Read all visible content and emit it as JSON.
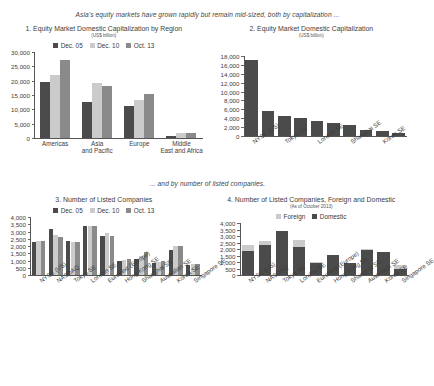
{
  "banner": {
    "top": "Asia's equity markets have grown rapidly but remain mid-sized, both by capitalization ...",
    "middle": "... and by number of listed companies."
  },
  "chart_data": [
    {
      "id": "panel1",
      "type": "bar",
      "title": "1. Equity Market Domestic Capitalization by Region",
      "subtitle": "(US$ billion)",
      "xlabel": "",
      "ylabel": "",
      "ylim": [
        0,
        30000
      ],
      "yticks": [
        0,
        5000,
        10000,
        15000,
        20000,
        25000,
        30000
      ],
      "yticklabels": [
        "0",
        "5,000",
        "10,000",
        "15,000",
        "20,000",
        "25,000",
        "30,000"
      ],
      "grid": false,
      "legend_position": "top",
      "categories": [
        "Americas",
        "Asia and Pacific",
        "Europe",
        "Middle East and Africa"
      ],
      "series": [
        {
          "name": "Dec. 05",
          "color": "#4b4b4b",
          "values": [
            19400,
            12700,
            11300,
            700
          ]
        },
        {
          "name": "Dec. 10",
          "color": "#cbcbcb",
          "values": [
            22100,
            19200,
            13300,
            1600
          ]
        },
        {
          "name": "Oct. 13",
          "color": "#8a8a8a",
          "values": [
            27200,
            18300,
            15200,
            1750
          ]
        }
      ]
    },
    {
      "id": "panel2",
      "type": "bar",
      "title": "2. Equity Market Domestic Capitalization",
      "subtitle": "(US$ billion)",
      "xlabel": "",
      "ylabel": "",
      "ylim": [
        0,
        18000
      ],
      "yticks": [
        0,
        2000,
        4000,
        6000,
        8000,
        10000,
        12000,
        14000,
        16000,
        18000
      ],
      "yticklabels": [
        "0",
        "2,000",
        "4,000",
        "6,000",
        "8,000",
        "10,000",
        "12,000",
        "14,000",
        "16,000",
        "18,000"
      ],
      "grid": false,
      "legend_position": "none",
      "categories": [
        "NYSE (US)",
        "NASDAQ",
        "Tokyo SE",
        "Euronext (Europe)",
        "London SE",
        "Hong Kong SE",
        "Shanghai SE",
        "Australian SE",
        "Korea SE",
        "Singapore SE"
      ],
      "xticklabels_shown": [
        "NYSE (US)",
        "",
        "Tokyo SE",
        "",
        "London SE",
        "",
        "Shanghai SE",
        "",
        "Korea SE",
        ""
      ],
      "series": [
        {
          "name": "Capitalization",
          "color": "#4b4b4b",
          "values": [
            17100,
            5700,
            4400,
            4150,
            3400,
            3000,
            2400,
            1400,
            1200,
            750
          ]
        }
      ]
    },
    {
      "id": "panel3",
      "type": "bar",
      "title": "3. Number of Listed Companies",
      "subtitle": "",
      "xlabel": "",
      "ylabel": "",
      "ylim": [
        0,
        4000
      ],
      "yticks": [
        0,
        500,
        1000,
        1500,
        2000,
        2500,
        3000,
        3500,
        4000
      ],
      "yticklabels": [
        "0",
        "500",
        "1,000",
        "1,500",
        "2,000",
        "2,500",
        "3,000",
        "3,500",
        "4,000"
      ],
      "grid": false,
      "legend_position": "top",
      "categories": [
        "NYSE (US)",
        "NASDAQ",
        "Tokyo SE",
        "London SE",
        "Euronext (Europe)",
        "Hong Kong SE",
        "Shanghai SE",
        "Australian SE",
        "Korea SE",
        "Singapore SE"
      ],
      "series": [
        {
          "name": "Dec. 05",
          "color": "#4b4b4b",
          "values": [
            2270,
            3170,
            2350,
            3400,
            2720,
            975,
            1120,
            860,
            1720,
            680
          ]
        },
        {
          "name": "Dec. 10",
          "color": "#cbcbcb",
          "values": [
            2320,
            2750,
            2290,
            3360,
            2930,
            1050,
            1290,
            910,
            2000,
            775
          ]
        },
        {
          "name": "Oct. 13",
          "color": "#8a8a8a",
          "values": [
            2340,
            2620,
            2250,
            3350,
            2720,
            1090,
            1580,
            950,
            2030,
            790
          ]
        }
      ]
    },
    {
      "id": "panel4",
      "type": "bar",
      "stacked": true,
      "title": "4. Number of Listed Companies, Foreign and Domestic",
      "subtitle": "(As of October 2013)",
      "xlabel": "",
      "ylabel": "",
      "ylim": [
        0,
        4000
      ],
      "yticks": [
        0,
        500,
        1000,
        1500,
        2000,
        2500,
        3000,
        3500,
        4000
      ],
      "yticklabels": [
        "0",
        "500",
        "1,000",
        "1,500",
        "2,000",
        "2,500",
        "3,000",
        "3,500",
        "4,000"
      ],
      "grid": false,
      "legend_position": "top",
      "categories": [
        "NYSE (US)",
        "NASDAQ",
        "Tokyo SE",
        "London SE",
        "Euronext (Europe)",
        "Hong Kong SE",
        "Shanghai SE",
        "Australian SE",
        "Korea SE",
        "Singapore SE"
      ],
      "series": [
        {
          "name": "Domestic",
          "color": "#4b4b4b",
          "values": [
            1840,
            2330,
            3390,
            2160,
            920,
            1550,
            940,
            1940,
            1760,
            480
          ]
        },
        {
          "name": "Foreign",
          "color": "#cbcbcb",
          "values": [
            500,
            290,
            10,
            570,
            100,
            20,
            0,
            50,
            10,
            300
          ]
        }
      ]
    }
  ]
}
